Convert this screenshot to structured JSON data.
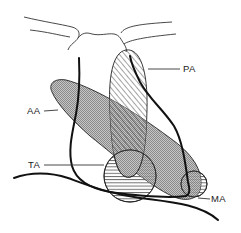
{
  "figure": {
    "type": "anatomical schematic",
    "regions": [
      {
        "id": "PA",
        "label": "PA",
        "shape": "elongated vertical oval",
        "pattern": "diagonal hatching"
      },
      {
        "id": "AA",
        "label": "AA",
        "shape": "oblique elongated band",
        "pattern": "fine stipple / cross-hatch (gray)"
      },
      {
        "id": "TA",
        "label": "TA",
        "shape": "circle",
        "pattern": "horizontal hatching"
      },
      {
        "id": "MA",
        "label": "MA",
        "shape": "small circle",
        "pattern": "horizontal hatching"
      }
    ]
  },
  "labels": {
    "pa": "PA",
    "aa": "AA",
    "ta": "TA",
    "ma": "MA"
  },
  "colors": {
    "line": "#111111",
    "fill_gray": "#b8b8b8",
    "background": "#ffffff"
  }
}
